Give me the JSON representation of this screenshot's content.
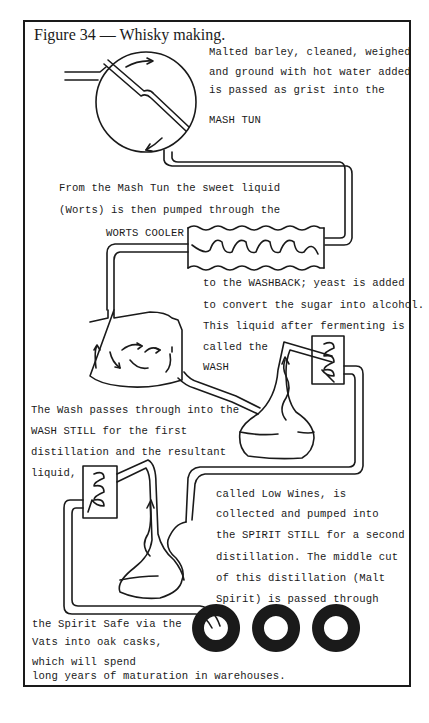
{
  "figure": {
    "title": "Figure 34 — Whisky making."
  },
  "stages": [
    {
      "id": "mash-tun",
      "label": "MASH TUN"
    },
    {
      "id": "worts-cooler",
      "label": "WORTS COOLER"
    },
    {
      "id": "washback",
      "label": "WASHBACK"
    },
    {
      "id": "wash-still",
      "label": "WASH STILL"
    },
    {
      "id": "spirit-still",
      "label": "SPIRIT STILL"
    },
    {
      "id": "casks",
      "label": "oak casks"
    }
  ],
  "text": {
    "mash_1": "Malted barley, cleaned, weighed",
    "mash_2": "and ground with hot water added",
    "mash_3": "is passed as grist into the",
    "mash_4": "MASH TUN",
    "worts_1": "From the Mash Tun the sweet liquid",
    "worts_2": "(Worts) is then pumped through the",
    "worts_3": "WORTS COOLER",
    "wash_1": "to the WASHBACK; yeast is added",
    "wash_2": "to convert the sugar into alcohol.",
    "wash_3": "This liquid after fermenting is",
    "wash_4": "called the",
    "wash_5": "WASH",
    "still_1": "The Wash passes through into the",
    "still_2": "WASH STILL for the first",
    "still_3": "distillation and the resultant",
    "still_4": "liquid,",
    "spirit_1": "called Low Wines, is",
    "spirit_2": "collected and pumped into",
    "spirit_3": "the SPIRIT STILL for  a second",
    "spirit_4": "distillation.  The middle cut",
    "spirit_5": "of this distillation (Malt",
    "spirit_6": "Spirit) is passed through",
    "cask_1": "the Spirit Safe via the",
    "cask_2": "Vats into oak casks,",
    "cask_3": "which will spend",
    "cask_4": "long years of maturation in warehouses."
  },
  "colors": {
    "ink": "#1a1a1a",
    "paper": "#ffffff"
  }
}
